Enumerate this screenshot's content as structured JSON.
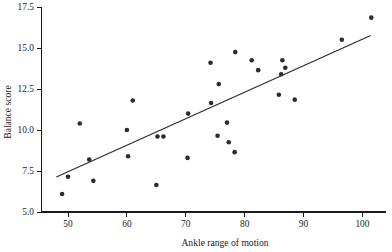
{
  "chart_data": {
    "type": "scatter",
    "title": "",
    "xlabel": "Ankle range of motion",
    "ylabel": "Balance score",
    "xlim": [
      45.5,
      104.0
    ],
    "ylim": [
      5.0,
      17.5
    ],
    "xticks": [
      50,
      60,
      70,
      80,
      90,
      100
    ],
    "xtick_labels": [
      "50",
      "60",
      "70",
      "80",
      "90",
      "100"
    ],
    "yticks": [
      5.0,
      7.5,
      10.0,
      12.5,
      15.0,
      17.5
    ],
    "ytick_labels": [
      "5.0",
      "7.5",
      "10.0",
      "12.5",
      "15.0",
      "17.5"
    ],
    "grid": false,
    "legend": "none",
    "marker_color": "#2b2b33",
    "line_color": "#2b2b33",
    "axis_color": "#1a1a1a",
    "points": [
      {
        "x": 49.0,
        "y": 6.1
      },
      {
        "x": 50.0,
        "y": 7.15
      },
      {
        "x": 52.0,
        "y": 10.4
      },
      {
        "x": 53.6,
        "y": 8.2
      },
      {
        "x": 54.3,
        "y": 6.9
      },
      {
        "x": 60.0,
        "y": 10.0
      },
      {
        "x": 60.2,
        "y": 8.4
      },
      {
        "x": 61.0,
        "y": 11.8
      },
      {
        "x": 65.0,
        "y": 6.65
      },
      {
        "x": 65.2,
        "y": 9.6
      },
      {
        "x": 66.2,
        "y": 9.6
      },
      {
        "x": 70.3,
        "y": 8.3
      },
      {
        "x": 70.4,
        "y": 11.0
      },
      {
        "x": 74.2,
        "y": 14.1
      },
      {
        "x": 74.3,
        "y": 11.65
      },
      {
        "x": 75.4,
        "y": 9.65
      },
      {
        "x": 75.6,
        "y": 12.8
      },
      {
        "x": 77.0,
        "y": 10.45
      },
      {
        "x": 77.3,
        "y": 9.25
      },
      {
        "x": 78.3,
        "y": 8.65
      },
      {
        "x": 78.4,
        "y": 14.75
      },
      {
        "x": 81.2,
        "y": 14.25
      },
      {
        "x": 82.3,
        "y": 13.65
      },
      {
        "x": 85.8,
        "y": 12.15
      },
      {
        "x": 86.2,
        "y": 13.4
      },
      {
        "x": 86.4,
        "y": 14.25
      },
      {
        "x": 86.9,
        "y": 13.8
      },
      {
        "x": 88.5,
        "y": 11.85
      },
      {
        "x": 96.5,
        "y": 15.5
      },
      {
        "x": 101.5,
        "y": 16.85
      }
    ],
    "fit_line": {
      "label": "least-squares regression line",
      "x_start": 48.1,
      "y_start": 7.15,
      "x_end": 101.3,
      "y_end": 15.75
    }
  }
}
